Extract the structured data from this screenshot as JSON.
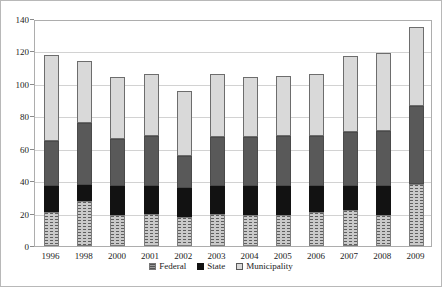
{
  "chart_data": {
    "type": "bar",
    "stacked": true,
    "title": "",
    "xlabel": "",
    "ylabel": "",
    "ylim": [
      0,
      140
    ],
    "ytick_interval": 20,
    "yticks": [
      0,
      20,
      40,
      60,
      80,
      100,
      120,
      140
    ],
    "grid": "horizontal",
    "legend_position": "bottom",
    "legend_entries": [
      "Federal",
      "State",
      "Municipality"
    ],
    "categories": [
      "1996",
      "1998",
      "2000",
      "2001",
      "2002",
      "2003",
      "2004",
      "2005",
      "2006",
      "2007",
      "2008",
      "2009"
    ],
    "series": [
      {
        "name": "Federal",
        "fill": "pattern",
        "values": [
          21,
          28,
          19,
          20,
          18,
          20,
          19,
          19,
          21,
          22,
          19,
          38
        ]
      },
      {
        "name": "State",
        "fill": "black",
        "values": [
          16,
          10,
          18,
          17,
          18,
          17,
          18,
          18,
          16,
          15,
          18,
          0
        ]
      },
      {
        "name": "Municipality",
        "fill": "darkgray",
        "values": [
          28,
          38,
          29,
          31,
          20,
          30,
          30,
          31,
          31,
          33,
          34,
          48
        ]
      },
      {
        "name": "",
        "fill": "lightgray",
        "note": "topmost light-gray segment, no legend entry visible",
        "values": [
          53,
          38,
          38,
          38,
          40,
          39,
          37,
          37,
          38,
          47,
          48,
          49
        ]
      }
    ],
    "totals": [
      118,
      114,
      104,
      106,
      96,
      106,
      104,
      105,
      106,
      117,
      119,
      135
    ]
  },
  "legend": {
    "items": [
      {
        "label": "Federal",
        "swatch": "pattern"
      },
      {
        "label": "State",
        "swatch": "black"
      },
      {
        "label": "Municipality",
        "swatch": "lightgray"
      }
    ]
  },
  "colors": {
    "pattern_base": "#c9c9c9",
    "pattern_dash": "#5e5e5e",
    "black": "#121212",
    "darkgray": "#595959",
    "lightgray": "#d9d9d9",
    "gridline": "#d2d2d2",
    "plot_border": "#adadad"
  }
}
